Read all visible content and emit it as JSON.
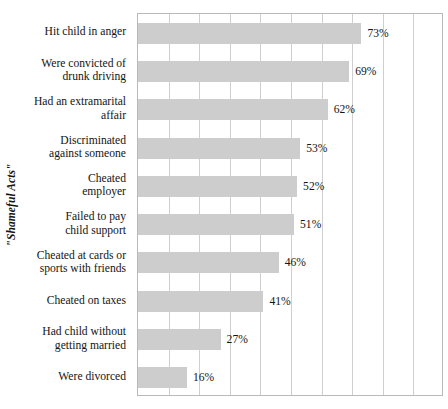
{
  "chart_data": {
    "type": "bar",
    "orientation": "horizontal",
    "title": "",
    "xlabel": "",
    "ylabel": "\"Shameful Acts\"",
    "xlim": [
      0,
      100
    ],
    "ylim": null,
    "grid": true,
    "gridline_interval": 10,
    "legend": false,
    "value_suffix": "%",
    "bar_color": "#cdcdcd",
    "plot_border_color": "#b9b9b9",
    "gridline_color": "#cfcfcf",
    "categories": [
      "Hit child in anger",
      "Were convicted of drunk driving",
      "Had an extramarital affair",
      "Discriminated against someone",
      "Cheated employer",
      "Failed to pay child support",
      "Cheated at cards or sports with friends",
      "Cheated on taxes",
      "Had child without getting married",
      "Were divorced"
    ],
    "category_lines": [
      [
        "Hit child in anger"
      ],
      [
        "Were convicted of",
        "drunk driving"
      ],
      [
        "Had an extramarital",
        "affair"
      ],
      [
        "Discriminated",
        "against someone"
      ],
      [
        "Cheated",
        "employer"
      ],
      [
        "Failed to pay",
        "child support"
      ],
      [
        "Cheated at cards or",
        "sports with friends"
      ],
      [
        "Cheated on taxes"
      ],
      [
        "Had child without",
        "getting married"
      ],
      [
        "Were divorced"
      ]
    ],
    "values": [
      73,
      69,
      62,
      53,
      52,
      51,
      46,
      41,
      27,
      16
    ],
    "value_labels": [
      "73%",
      "69%",
      "62%",
      "53%",
      "52%",
      "51%",
      "46%",
      "41%",
      "27%",
      "16%"
    ]
  }
}
